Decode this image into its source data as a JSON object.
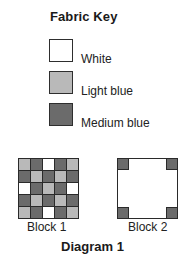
{
  "fabric_key": {
    "title": "Fabric Key",
    "items": [
      {
        "label": "White",
        "color": "#ffffff"
      },
      {
        "label": "Light blue",
        "color": "#b9b9b9"
      },
      {
        "label": "Medium blue",
        "color": "#6b6b6b"
      }
    ]
  },
  "colors": {
    "W": "#ffffff",
    "L": "#b9b9b9",
    "M": "#6b6b6b",
    "border": "#2a2a2a"
  },
  "blocks": [
    {
      "label": "Block 1",
      "grid": [
        [
          "L",
          "M",
          "W",
          "M",
          "L"
        ],
        [
          "M",
          "L",
          "M",
          "L",
          "M"
        ],
        [
          "W",
          "M",
          "L",
          "M",
          "W"
        ],
        [
          "M",
          "L",
          "M",
          "L",
          "M"
        ],
        [
          "L",
          "M",
          "W",
          "M",
          "L"
        ]
      ]
    },
    {
      "label": "Block 2",
      "background": "W",
      "corners": [
        "M",
        "M",
        "M",
        "M"
      ]
    }
  ],
  "caption": "Diagram 1"
}
